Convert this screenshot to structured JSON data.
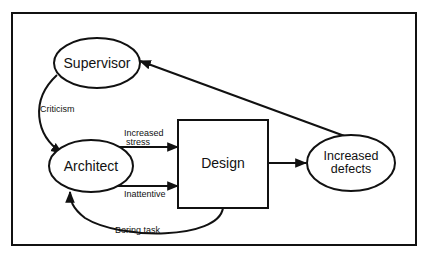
{
  "diagram": {
    "colors": {
      "stroke": "#111111",
      "background": "#ffffff"
    },
    "nodes": {
      "supervisor": {
        "label": "Supervisor",
        "shape": "ellipse"
      },
      "architect": {
        "label": "Architect",
        "shape": "ellipse"
      },
      "design": {
        "label": "Design",
        "shape": "rectangle"
      },
      "defects": {
        "label_line1": "Increased",
        "label_line2": "defects",
        "shape": "ellipse"
      }
    },
    "edges": {
      "criticism": {
        "from": "Supervisor",
        "to": "Architect",
        "label": "Criticism"
      },
      "stress": {
        "from": "Architect",
        "to": "Design",
        "label_line1": "Increased",
        "label_line2": "stress"
      },
      "inattentive": {
        "from": "Architect",
        "to": "Design",
        "label": "Inattentive"
      },
      "boring": {
        "from": "Design",
        "to": "Architect",
        "label": "Boring task"
      },
      "defects_out": {
        "from": "Design",
        "to": "Increased defects",
        "label": ""
      },
      "feedback": {
        "from": "Increased defects",
        "to": "Supervisor",
        "label": ""
      }
    }
  }
}
